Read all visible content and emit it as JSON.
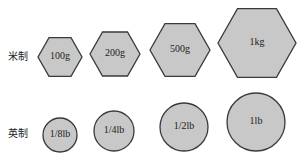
{
  "rows": [
    {
      "label": "米制",
      "shape": "hexagon",
      "items": [
        {
          "text": "100g",
          "cx": 60,
          "cy": 57,
          "r": 22
        },
        {
          "text": "200g",
          "cx": 115,
          "cy": 54,
          "r": 25
        },
        {
          "text": "500g",
          "cx": 180,
          "cy": 50,
          "r": 30
        },
        {
          "text": "1kg",
          "cx": 257,
          "cy": 43,
          "r": 39
        }
      ]
    },
    {
      "label": "英制",
      "shape": "circle",
      "items": [
        {
          "text": "1/8lb",
          "cx": 60,
          "cy": 135,
          "r": 17
        },
        {
          "text": "1/4lb",
          "cx": 114,
          "cy": 131,
          "r": 20
        },
        {
          "text": "1/2lb",
          "cx": 184,
          "cy": 127,
          "r": 24
        },
        {
          "text": "1lb",
          "cx": 256,
          "cy": 122,
          "r": 29
        }
      ]
    }
  ],
  "colors": {
    "fill": "#c8c8c8",
    "stroke": "#3a3a3a",
    "text": "#222222"
  }
}
